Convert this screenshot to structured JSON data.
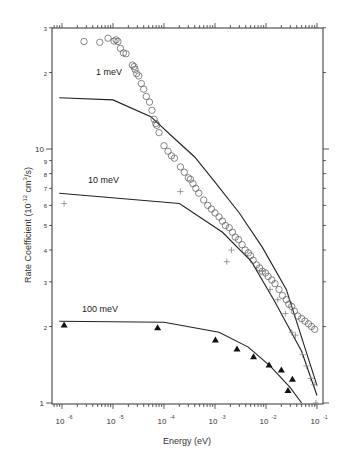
{
  "chart_data": {
    "type": "scatter",
    "title": "",
    "xlabel": "Energy (eV)",
    "ylabel": "Rate Coefficient (10^-12 cm^3/s)",
    "xscale": "log",
    "yscale": "log",
    "xlim": [
      6e-07,
      0.12
    ],
    "ylim": [
      1,
      30
    ],
    "x_ticks": [
      {
        "value": 1e-06,
        "base": "10",
        "exp": "-6"
      },
      {
        "value": 1e-05,
        "base": "10",
        "exp": "-5"
      },
      {
        "value": 0.0001,
        "base": "10",
        "exp": "-4"
      },
      {
        "value": 0.001,
        "base": "10",
        "exp": "-3"
      },
      {
        "value": 0.01,
        "base": "10",
        "exp": "-2"
      },
      {
        "value": 0.1,
        "base": "10",
        "exp": "-1"
      }
    ],
    "y_ticks": [
      {
        "value": 1,
        "label": "1"
      },
      {
        "value": 2,
        "label": "2"
      },
      {
        "value": 3,
        "label": "3"
      },
      {
        "value": 4,
        "label": "4"
      },
      {
        "value": 5,
        "label": "5"
      },
      {
        "value": 6,
        "label": "6"
      },
      {
        "value": 7,
        "label": "7"
      },
      {
        "value": 8,
        "label": "8"
      },
      {
        "value": 9,
        "label": "9"
      },
      {
        "value": 10,
        "label": "10"
      },
      {
        "value": 20,
        "label": "2"
      },
      {
        "value": 30,
        "label": "3"
      }
    ],
    "grid": false,
    "legend": "inline labels",
    "annotations": [
      {
        "text": "1 meV",
        "x": 7e-06,
        "y": 20
      },
      {
        "text": "10 meV",
        "x": 7e-06,
        "y": 7.4
      },
      {
        "text": "100 meV",
        "x": 7e-06,
        "y": 2.45
      }
    ],
    "series": [
      {
        "name": "1 meV data",
        "marker": "circle-open",
        "points": [
          [
            2.7e-06,
            26.5
          ],
          [
            5.5e-06,
            26.3
          ],
          [
            8e-06,
            27.3
          ],
          [
            1.05e-05,
            26.6
          ],
          [
            1.15e-05,
            26.9
          ],
          [
            1.25e-05,
            26.5
          ],
          [
            1.4e-05,
            24.9
          ],
          [
            1.6e-05,
            23.9
          ],
          [
            1.8e-05,
            23.7
          ],
          [
            2.4e-05,
            21.4
          ],
          [
            2.7e-05,
            20.6
          ],
          [
            2.6e-05,
            21.1
          ],
          [
            2.9e-05,
            19.8
          ],
          [
            3.2e-05,
            19.4
          ],
          [
            3.6e-05,
            18.1
          ],
          [
            4e-05,
            17.2
          ],
          [
            4.5e-05,
            16.1
          ],
          [
            5.2e-05,
            15.3
          ],
          [
            5.8e-05,
            14.2
          ],
          [
            6.4e-05,
            13.1
          ],
          [
            6.9e-05,
            12.6
          ],
          [
            7.2e-05,
            12.4
          ],
          [
            8e-05,
            11.6
          ],
          [
            0.0001,
            10.3
          ],
          [
            0.00012,
            9.8
          ],
          [
            0.00014,
            9.4
          ],
          [
            0.00016,
            9.2
          ],
          [
            0.00021,
            8.5
          ],
          [
            0.00025,
            8.1
          ],
          [
            0.0003,
            7.7
          ],
          [
            0.00033,
            7.6
          ],
          [
            0.00037,
            7.3
          ],
          [
            0.00042,
            7.0
          ],
          [
            0.00048,
            6.7
          ],
          [
            0.0006,
            6.3
          ],
          [
            0.00072,
            6.0
          ],
          [
            0.00085,
            5.8
          ],
          [
            0.001,
            5.6
          ],
          [
            0.0012,
            5.4
          ],
          [
            0.0014,
            5.2
          ],
          [
            0.0016,
            5.0
          ],
          [
            0.0019,
            4.9
          ],
          [
            0.0022,
            4.7
          ],
          [
            0.0025,
            4.5
          ],
          [
            0.0029,
            4.4
          ],
          [
            0.0034,
            4.2
          ],
          [
            0.0039,
            4.0
          ],
          [
            0.0045,
            3.9
          ],
          [
            0.005,
            3.8
          ],
          [
            0.0056,
            3.65
          ],
          [
            0.0065,
            3.5
          ],
          [
            0.0075,
            3.4
          ],
          [
            0.0085,
            3.3
          ],
          [
            0.0098,
            3.25
          ],
          [
            0.011,
            3.15
          ],
          [
            0.013,
            3.05
          ],
          [
            0.015,
            2.95
          ],
          [
            0.018,
            2.8
          ],
          [
            0.021,
            2.65
          ],
          [
            0.025,
            2.55
          ],
          [
            0.028,
            2.45
          ],
          [
            0.032,
            2.4
          ],
          [
            0.036,
            2.3
          ],
          [
            0.042,
            2.2
          ],
          [
            0.05,
            2.15
          ],
          [
            0.058,
            2.1
          ],
          [
            0.068,
            2.05
          ],
          [
            0.078,
            2.0
          ],
          [
            0.09,
            1.95
          ]
        ]
      },
      {
        "name": "10 meV data",
        "marker": "plus",
        "points": [
          [
            1.1e-06,
            6.1
          ],
          [
            0.00021,
            6.8
          ],
          [
            0.0017,
            3.6
          ],
          [
            0.0021,
            4.0
          ],
          [
            0.0085,
            3.3
          ],
          [
            0.012,
            2.8
          ],
          [
            0.017,
            2.55
          ],
          [
            0.024,
            2.25
          ],
          [
            0.032,
            1.9
          ],
          [
            0.038,
            1.85
          ],
          [
            0.052,
            1.55
          ],
          [
            0.062,
            1.4
          ],
          [
            0.075,
            1.25
          ],
          [
            0.088,
            1.18
          ],
          [
            0.095,
            1.0
          ]
        ]
      },
      {
        "name": "100 meV data",
        "marker": "triangle-filled",
        "points": [
          [
            1.1e-06,
            2.03
          ],
          [
            7.5e-05,
            1.98
          ],
          [
            0.00102,
            1.77
          ],
          [
            0.0027,
            1.63
          ],
          [
            0.0057,
            1.52
          ],
          [
            0.0115,
            1.41
          ],
          [
            0.02,
            1.35
          ],
          [
            0.033,
            1.24
          ],
          [
            0.027,
            1.12
          ]
        ]
      }
    ],
    "curves": [
      {
        "name": "1 meV",
        "points": [
          [
            8.8e-07,
            15.9
          ],
          [
            1e-05,
            15.6
          ],
          [
            5.5e-05,
            13.4
          ],
          [
            0.00016,
            11.0
          ],
          [
            0.0004,
            9.3
          ],
          [
            0.001,
            7.4
          ],
          [
            0.003,
            5.6
          ],
          [
            0.0085,
            4.1
          ],
          [
            0.025,
            2.8
          ],
          [
            0.1,
            1.17
          ]
        ]
      },
      {
        "name": "10 meV",
        "points": [
          [
            8.8e-07,
            6.7
          ],
          [
            0.0002,
            6.1
          ],
          [
            0.0014,
            4.7
          ],
          [
            0.0052,
            3.6
          ],
          [
            0.015,
            2.5
          ],
          [
            0.05,
            1.6
          ],
          [
            0.1,
            1.07
          ]
        ]
      },
      {
        "name": "100 meV",
        "points": [
          [
            8.8e-07,
            2.1
          ],
          [
            0.0001,
            2.08
          ],
          [
            0.0012,
            1.9
          ],
          [
            0.0045,
            1.66
          ],
          [
            0.012,
            1.4
          ],
          [
            0.03,
            1.15
          ],
          [
            0.05,
            1.0
          ]
        ]
      }
    ]
  }
}
